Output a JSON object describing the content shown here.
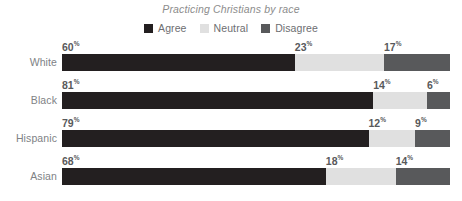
{
  "chart_data": {
    "type": "bar",
    "subtype": "stacked-horizontal-100",
    "title": "Practicing Christians by race",
    "xlabel": "",
    "ylabel": "",
    "xlim": [
      0,
      100
    ],
    "grid": false,
    "legend_position": "top-center",
    "value_suffix": "%",
    "categories": [
      "White",
      "Black",
      "Hispanic",
      "Asian"
    ],
    "series": [
      {
        "name": "Agree",
        "color": "#231f20",
        "values": [
          60,
          81,
          79,
          68
        ]
      },
      {
        "name": "Neutral",
        "color": "#e0e0e0",
        "values": [
          23,
          14,
          12,
          18
        ]
      },
      {
        "name": "Disagree",
        "color": "#58595b",
        "values": [
          17,
          6,
          9,
          14
        ]
      }
    ],
    "rows": [
      {
        "label": "White",
        "segments": [
          {
            "name": "Agree",
            "value": 60,
            "value_text": "60",
            "suffix": "%",
            "color": "#231f20"
          },
          {
            "name": "Neutral",
            "value": 23,
            "value_text": "23",
            "suffix": "%",
            "color": "#e0e0e0"
          },
          {
            "name": "Disagree",
            "value": 17,
            "value_text": "17",
            "suffix": "%",
            "color": "#58595b"
          }
        ]
      },
      {
        "label": "Black",
        "segments": [
          {
            "name": "Agree",
            "value": 81,
            "value_text": "81",
            "suffix": "%",
            "color": "#231f20"
          },
          {
            "name": "Neutral",
            "value": 14,
            "value_text": "14",
            "suffix": "%",
            "color": "#e0e0e0"
          },
          {
            "name": "Disagree",
            "value": 6,
            "value_text": "6",
            "suffix": "%",
            "color": "#58595b"
          }
        ]
      },
      {
        "label": "Hispanic",
        "segments": [
          {
            "name": "Agree",
            "value": 79,
            "value_text": "79",
            "suffix": "%",
            "color": "#231f20"
          },
          {
            "name": "Neutral",
            "value": 12,
            "value_text": "12",
            "suffix": "%",
            "color": "#e0e0e0"
          },
          {
            "name": "Disagree",
            "value": 9,
            "value_text": "9",
            "suffix": "%",
            "color": "#58595b"
          }
        ]
      },
      {
        "label": "Asian",
        "segments": [
          {
            "name": "Agree",
            "value": 68,
            "value_text": "68",
            "suffix": "%",
            "color": "#231f20"
          },
          {
            "name": "Neutral",
            "value": 18,
            "value_text": "18",
            "suffix": "%",
            "color": "#e0e0e0"
          },
          {
            "name": "Disagree",
            "value": 14,
            "value_text": "14",
            "suffix": "%",
            "color": "#58595b"
          }
        ]
      }
    ]
  },
  "legend": {
    "items": [
      {
        "label": "Agree",
        "color": "#231f20"
      },
      {
        "label": "Neutral",
        "color": "#e0e0e0"
      },
      {
        "label": "Disagree",
        "color": "#58595b"
      }
    ]
  },
  "colors": {
    "agree": "#231f20",
    "neutral": "#e0e0e0",
    "disagree": "#58595b",
    "title_text": "#8c8c8c",
    "label_text": "#808285",
    "value_text": "#58595b",
    "background": "#ffffff"
  }
}
